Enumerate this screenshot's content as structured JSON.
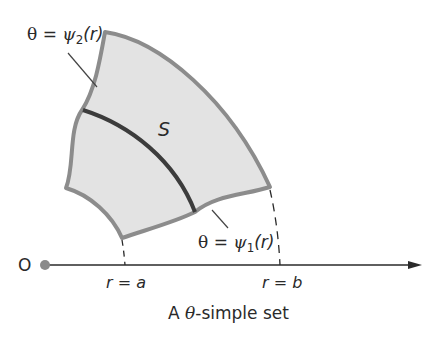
{
  "diagram": {
    "caption_prefix": "A ",
    "caption_theta": "θ",
    "caption_suffix": "-simple set",
    "origin_label": "O",
    "region_label": "S",
    "upper_curve_label": {
      "lhs": "θ",
      "eq": " = ",
      "psi": "ψ",
      "sub": "2",
      "arg": "(r)"
    },
    "lower_curve_label": {
      "lhs": "θ",
      "eq": " = ",
      "psi": "ψ",
      "sub": "1",
      "arg": "(r)"
    },
    "r_a_label": "r = a",
    "r_b_label": "r = b",
    "colors": {
      "fill": "#e3e3e3",
      "boundary": "#8c8c8c",
      "inner_curve": "#3c3c3c",
      "axis": "#2a2a2a",
      "origin_dot": "#8a8a8a"
    }
  }
}
